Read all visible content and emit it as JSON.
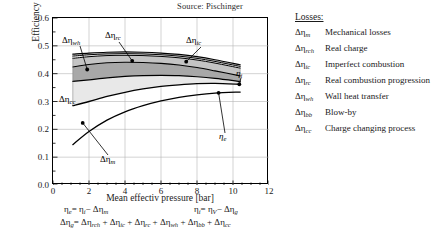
{
  "source_note": "Source: Pischinger",
  "axes": {
    "y_label": "Efficiency [-]",
    "x_label": "Mean effectiv pressure [bar]",
    "y_ticks": [
      "0.0",
      "0.1",
      "0.2",
      "0.3",
      "0.4",
      "0.5",
      "0.6"
    ],
    "x_ticks": [
      "0",
      "2",
      "4",
      "6",
      "8",
      "10",
      "12"
    ]
  },
  "callouts": {
    "wh": "Δηwh",
    "rc": "Δηrc",
    "ic": "Δηic",
    "cc": "Δηcc",
    "m": "Δηm",
    "eta_i": "ηi",
    "eta_e": "ηe"
  },
  "equations": {
    "eq1": "ηe = ηi − Δηm",
    "eq2": "ηi = ηV − Δηg",
    "eq3": "Δηg = Δηrch + Δηic + Δηrc + Δηwh + Δηbb + Δηcc"
  },
  "legend": {
    "title": "Losses:",
    "items": [
      {
        "symbol": "Δηm",
        "sub": "m",
        "label": "Mechanical losses"
      },
      {
        "symbol": "Δηrch",
        "sub": "rch",
        "label": "Real charge"
      },
      {
        "symbol": "Δηic",
        "sub": "ic",
        "label": "Imperfect combustion"
      },
      {
        "symbol": "Δηrc",
        "sub": "rc",
        "label": "Real combustion progression"
      },
      {
        "symbol": "Δηwh",
        "sub": "wh",
        "label": "Wall heat transfer"
      },
      {
        "symbol": "Δηbb",
        "sub": "bb",
        "label": "Blow-by"
      },
      {
        "symbol": "Δηcc",
        "sub": "cc",
        "label": "Charge changing process"
      }
    ]
  },
  "colors": {
    "band_light": "#e8e8e8",
    "band_mid": "#d0d0d0",
    "band_dark": "#a8a8a8",
    "band_pale": "#f0f0f0",
    "line": "#000000",
    "grid": "#b5b5b5"
  },
  "chart_data": {
    "type": "area",
    "title": "",
    "subtitle": "Source: Pischinger",
    "xlabel": "Mean effectiv pressure [bar]",
    "ylabel": "Efficiency [-]",
    "xlim": [
      0,
      12
    ],
    "ylim": [
      0.0,
      0.6
    ],
    "x_ticks": [
      0,
      2,
      4,
      6,
      8,
      10,
      12
    ],
    "y_ticks": [
      0.0,
      0.1,
      0.2,
      0.3,
      0.4,
      0.5,
      0.6
    ],
    "grid": true,
    "legend_position": "right-outside",
    "x": [
      1.1,
      2.0,
      3.0,
      4.0,
      5.0,
      6.0,
      7.0,
      8.0,
      9.0,
      10.4
    ],
    "series": [
      {
        "name": "eta_V (theoretical efficiency, top boundary)",
        "values": [
          0.47,
          0.474,
          0.477,
          0.478,
          0.477,
          0.474,
          0.469,
          0.461,
          0.45,
          0.432
        ]
      },
      {
        "name": "after Delta_eta_rch (real charge)",
        "values": [
          0.463,
          0.468,
          0.471,
          0.472,
          0.471,
          0.468,
          0.463,
          0.455,
          0.444,
          0.426
        ]
      },
      {
        "name": "after Delta_eta_ic (imperfect combustion)",
        "values": [
          0.455,
          0.461,
          0.465,
          0.466,
          0.465,
          0.462,
          0.457,
          0.449,
          0.438,
          0.42
        ]
      },
      {
        "name": "after Delta_eta_rc (real combustion progression)",
        "values": [
          0.424,
          0.433,
          0.439,
          0.441,
          0.44,
          0.437,
          0.431,
          0.422,
          0.41,
          0.392
        ]
      },
      {
        "name": "after Delta_eta_wh (wall heat transfer)",
        "values": [
          0.372,
          0.378,
          0.385,
          0.39,
          0.393,
          0.394,
          0.393,
          0.389,
          0.383,
          0.372
        ]
      },
      {
        "name": "eta_i (indicated efficiency) = after Delta_eta_cc",
        "values": [
          0.285,
          0.3,
          0.318,
          0.333,
          0.345,
          0.354,
          0.36,
          0.364,
          0.365,
          0.362
        ]
      },
      {
        "name": "eta_e (effective efficiency)",
        "values": [
          0.145,
          0.192,
          0.233,
          0.263,
          0.285,
          0.302,
          0.315,
          0.324,
          0.33,
          0.334
        ]
      }
    ],
    "bands": [
      {
        "name": "Delta_eta_rch",
        "between": [
          "eta_V",
          "after_rch"
        ],
        "fill": "#d0d0d0"
      },
      {
        "name": "Delta_eta_ic",
        "between": [
          "after_rch",
          "after_ic"
        ],
        "fill": "#e8e8e8"
      },
      {
        "name": "Delta_eta_rc",
        "between": [
          "after_ic",
          "after_rc"
        ],
        "fill": "#c4c4c4"
      },
      {
        "name": "Delta_eta_wh",
        "between": [
          "after_rc",
          "after_wh"
        ],
        "fill": "#a8a8a8"
      },
      {
        "name": "Delta_eta_cc",
        "between": [
          "after_wh",
          "eta_i"
        ],
        "fill": "#e8e8e8"
      },
      {
        "name": "Delta_eta_m",
        "between": [
          "eta_i",
          "eta_e"
        ],
        "fill": "#ffffff"
      }
    ],
    "annotations": [
      {
        "text": "Δηwh",
        "point_x": 1.9,
        "point_y": 0.415
      },
      {
        "text": "Δηrc",
        "point_x": 4.4,
        "point_y": 0.446
      },
      {
        "text": "Δηic",
        "point_x": 7.4,
        "point_y": 0.443
      },
      {
        "text": "Δηcc",
        "point_x": 1.5,
        "point_y": 0.345
      },
      {
        "text": "Δηm",
        "point_x": 1.65,
        "point_y": 0.223
      },
      {
        "text": "ηi",
        "point_x": 10.35,
        "point_y": 0.362
      },
      {
        "text": "ηe",
        "point_x": 9.2,
        "point_y": 0.331
      }
    ]
  }
}
